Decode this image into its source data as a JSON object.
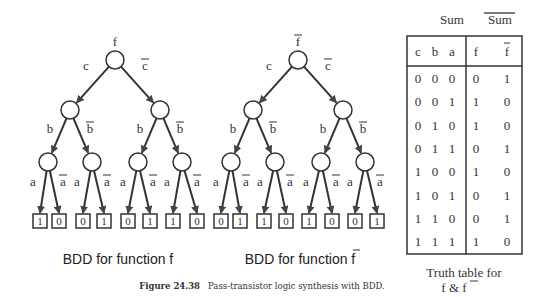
{
  "bdd_f": {
    "root_label": "f",
    "level1": {
      "left": "c",
      "right": "c̄"
    },
    "level2": {
      "left": "b",
      "right": "b̄"
    },
    "level3": {
      "left": "a",
      "right": "ā"
    },
    "leaves": [
      "1",
      "0",
      "0",
      "1",
      "0",
      "1",
      "1",
      "0"
    ],
    "caption": "BDD for function f"
  },
  "bdd_fbar": {
    "root_label": "f̄",
    "level1": {
      "left": "c",
      "right": "c̄"
    },
    "level2": {
      "left": "b",
      "right": "b̄"
    },
    "level3": {
      "left": "a",
      "right": "ā"
    },
    "leaves": [
      "0",
      "1",
      "1",
      "0",
      "1",
      "0",
      "0",
      "1"
    ],
    "caption_prefix": "BDD for function ",
    "caption_var": "f"
  },
  "truth_table": {
    "group_headers": {
      "sum": "Sum",
      "sum_bar": "Sum"
    },
    "columns": [
      "c",
      "b",
      "a",
      "f",
      "f"
    ],
    "rows": [
      [
        "0",
        "0",
        "0",
        "0",
        "1"
      ],
      [
        "0",
        "0",
        "1",
        "1",
        "0"
      ],
      [
        "0",
        "1",
        "0",
        "1",
        "0"
      ],
      [
        "0",
        "1",
        "1",
        "0",
        "1"
      ],
      [
        "1",
        "0",
        "0",
        "1",
        "0"
      ],
      [
        "1",
        "0",
        "1",
        "0",
        "1"
      ],
      [
        "1",
        "1",
        "0",
        "0",
        "1"
      ],
      [
        "1",
        "1",
        "1",
        "1",
        "0"
      ]
    ],
    "caption_line1": "Truth table for",
    "caption_line2_prefix": "f & ",
    "caption_line2_var": "f"
  },
  "figure_caption": {
    "number": "Figure 24.38",
    "text": "Pass-transistor logic synthesis with BDD."
  }
}
